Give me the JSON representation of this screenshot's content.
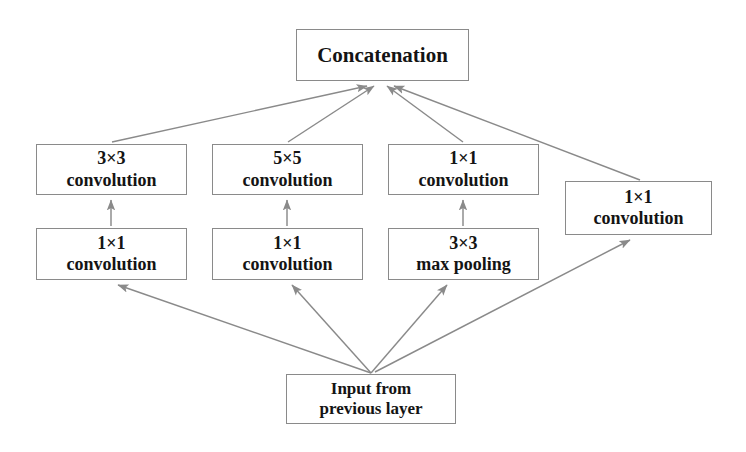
{
  "diagram": {
    "line_color": "#8a8a8a",
    "text_color": "#141414",
    "background": "#ffffff",
    "nodes": {
      "concat": {
        "line1": "Concatenation",
        "line2": ""
      },
      "conv3x3": {
        "line1": "3×3",
        "line2": "convolution"
      },
      "conv5x5": {
        "line1": "5×5",
        "line2": "convolution"
      },
      "conv1x1_top": {
        "line1": "1×1",
        "line2": "convolution"
      },
      "reduce1x1_a": {
        "line1": "1×1",
        "line2": "convolution"
      },
      "reduce1x1_b": {
        "line1": "1×1",
        "line2": "convolution"
      },
      "maxpool": {
        "line1": "3×3",
        "line2": "max pooling"
      },
      "conv1x1_right": {
        "line1": "1×1",
        "line2": "convolution"
      },
      "input": {
        "line1": "Input from",
        "line2": "previous layer"
      }
    },
    "edges": [
      {
        "from": "input",
        "to": "reduce1x1_a"
      },
      {
        "from": "input",
        "to": "reduce1x1_b"
      },
      {
        "from": "input",
        "to": "maxpool"
      },
      {
        "from": "input",
        "to": "conv1x1_right"
      },
      {
        "from": "reduce1x1_a",
        "to": "conv3x3"
      },
      {
        "from": "reduce1x1_b",
        "to": "conv5x5"
      },
      {
        "from": "maxpool",
        "to": "conv1x1_top"
      },
      {
        "from": "conv3x3",
        "to": "concat"
      },
      {
        "from": "conv5x5",
        "to": "concat"
      },
      {
        "from": "conv1x1_top",
        "to": "concat"
      },
      {
        "from": "conv1x1_right",
        "to": "concat"
      }
    ]
  }
}
